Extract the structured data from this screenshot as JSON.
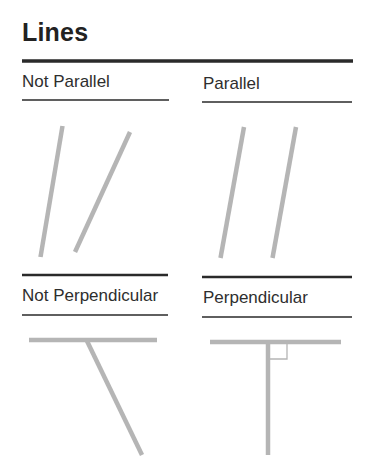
{
  "title": "Lines",
  "panels": [
    {
      "label": "Not Parallel",
      "concept": "lines that are not parallel"
    },
    {
      "label": "Parallel",
      "concept": "parallel lines"
    },
    {
      "label": "Not Perpendicular",
      "concept": "lines that are not perpendicular"
    },
    {
      "label": "Perpendicular",
      "concept": "perpendicular lines with right-angle marker"
    }
  ],
  "colors": {
    "rule": "#2a2a2a",
    "line": "#b5b5b5",
    "right_angle_marker": "#b5b5b5",
    "text": "#2a2a2a"
  }
}
